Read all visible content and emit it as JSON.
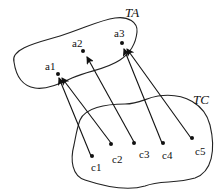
{
  "diagram": {
    "sets": [
      {
        "id": "TA",
        "label": "TA"
      },
      {
        "id": "TC",
        "label": "TC"
      }
    ],
    "ta_points": [
      {
        "id": "a1",
        "label": "a1"
      },
      {
        "id": "a2",
        "label": "a2"
      },
      {
        "id": "a3",
        "label": "a3"
      }
    ],
    "tc_points": [
      {
        "id": "c1",
        "label": "c1"
      },
      {
        "id": "c2",
        "label": "c2"
      },
      {
        "id": "c3",
        "label": "c3"
      },
      {
        "id": "c4",
        "label": "c4"
      },
      {
        "id": "c5",
        "label": "c5"
      }
    ],
    "mappings": [
      {
        "from": "c1",
        "to": "a1"
      },
      {
        "from": "c2",
        "to": "a1"
      },
      {
        "from": "c3",
        "to": "a2"
      },
      {
        "from": "c4",
        "to": "a3"
      },
      {
        "from": "c5",
        "to": "a3"
      }
    ],
    "colors": {
      "stroke": "#222222",
      "background": "#ffffff"
    }
  }
}
